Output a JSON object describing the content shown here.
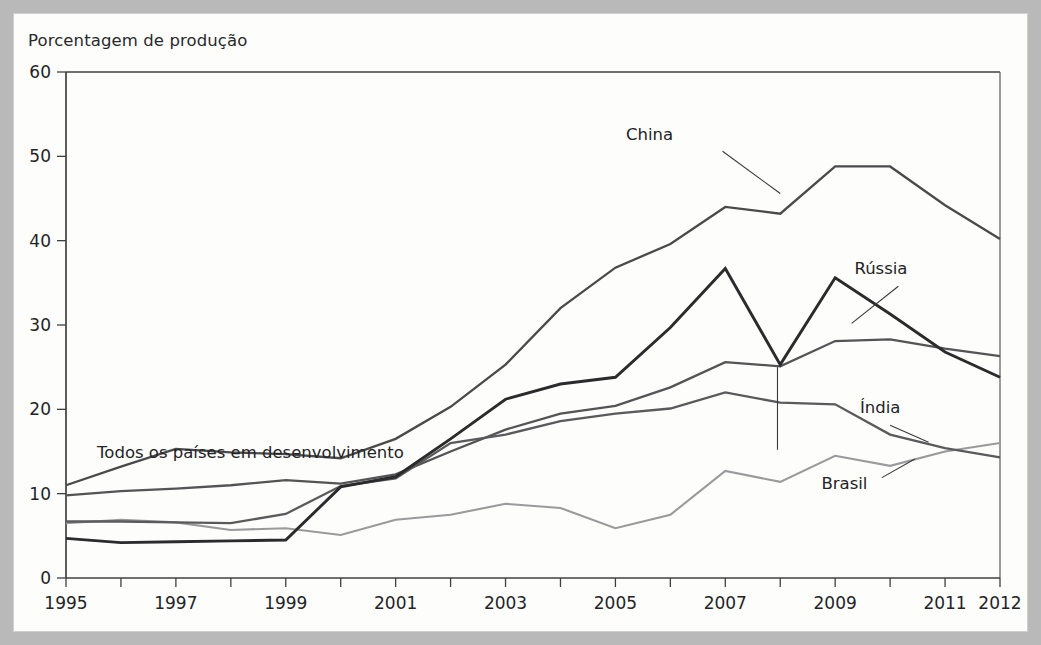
{
  "figure": {
    "title": "Porcentagem de produção",
    "border_color": "#b9b9b9",
    "panel_color": "#fdfdfc"
  },
  "chart_data": {
    "type": "line",
    "title": "Porcentagem de produção",
    "xlabel": "",
    "ylabel": "Porcentagem de produção",
    "xlim": [
      1995,
      2012
    ],
    "ylim": [
      0,
      60
    ],
    "yticks": [
      0,
      10,
      20,
      30,
      40,
      50,
      60
    ],
    "xticks": [
      1995,
      1996,
      1997,
      1998,
      1999,
      2000,
      2001,
      2002,
      2003,
      2004,
      2005,
      2006,
      2007,
      2008,
      2009,
      2010,
      2011,
      2012
    ],
    "xtick_labels": [
      "1995",
      "",
      "1997",
      "",
      "1999",
      "",
      "2001",
      "",
      "2003",
      "",
      "2005",
      "",
      "2007",
      "",
      "2009",
      "",
      "2011",
      "2012"
    ],
    "grid": false,
    "legend": "inline-annotations",
    "x": [
      1995,
      1996,
      1997,
      1998,
      1999,
      2000,
      2001,
      2002,
      2003,
      2004,
      2005,
      2006,
      2007,
      2008,
      2009,
      2010,
      2011,
      2012
    ],
    "series": [
      {
        "name": "China",
        "color": "#4a4a4c",
        "width": 2.3,
        "values": [
          11.0,
          13.2,
          15.3,
          14.9,
          14.7,
          14.2,
          16.5,
          20.3,
          25.3,
          32.0,
          36.8,
          39.6,
          44.0,
          43.2,
          48.8,
          48.8,
          44.2,
          40.2
        ]
      },
      {
        "name": "Rússia",
        "color": "#2b2b2d",
        "width": 2.9,
        "values": [
          4.7,
          4.2,
          4.3,
          4.4,
          4.5,
          10.8,
          12.0,
          16.5,
          21.2,
          23.0,
          23.8,
          29.7,
          36.7,
          25.3,
          35.6,
          31.3,
          26.8,
          23.8
        ]
      },
      {
        "name": "Todos os países em desenvolvimento",
        "color": "#545456",
        "width": 2.3,
        "values": [
          9.8,
          10.3,
          10.6,
          11.0,
          11.6,
          11.2,
          12.3,
          15.0,
          17.6,
          19.5,
          20.4,
          22.6,
          25.6,
          25.1,
          28.1,
          28.3,
          27.2,
          26.3
        ]
      },
      {
        "name": "Índia",
        "color": "#5a5a5c",
        "width": 2.3,
        "values": [
          6.7,
          6.7,
          6.6,
          6.5,
          7.6,
          10.9,
          11.8,
          16.0,
          17.0,
          18.6,
          19.5,
          20.1,
          22.0,
          20.8,
          20.6,
          17.0,
          15.4,
          14.3
        ]
      },
      {
        "name": "Brasil",
        "color": "#9a9a9c",
        "width": 2.1,
        "values": [
          6.5,
          6.9,
          6.6,
          5.7,
          5.9,
          5.1,
          6.9,
          7.5,
          8.8,
          8.3,
          5.9,
          7.5,
          12.7,
          11.4,
          14.5,
          13.3,
          15.0,
          16.0
        ]
      }
    ],
    "annotations": [
      {
        "text": "China",
        "x": 2006.05,
        "y": 51.9
      },
      {
        "text": "Rússia",
        "x": 2009.35,
        "y": 36.1
      },
      {
        "text": "Índia",
        "x": 2009.45,
        "y": 19.6
      },
      {
        "text": "Brasil",
        "x": 2008.75,
        "y": 10.6
      },
      {
        "text": "Todos os países em desenvolvimento",
        "x": 2001.15,
        "y": 14.2
      }
    ]
  }
}
